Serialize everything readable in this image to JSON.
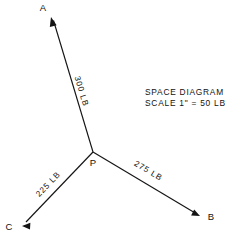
{
  "diagram": {
    "title_lines": {
      "line1": "SPACE  DIAGRAM",
      "line2": "SCALE  1\" = 50 LB"
    },
    "origin": {
      "label": "P",
      "x": 93,
      "y": 152
    },
    "stroke_color": "#141414",
    "text_color": "#111111",
    "background_color": "#ffffff",
    "forces": [
      {
        "id": "force-a",
        "endpoint_label": "A",
        "magnitude": "300 LB",
        "magnitude_value": 300,
        "units": "LB",
        "tip_x": 51,
        "tip_y": 17,
        "label_x": 43,
        "label_y": 11
      },
      {
        "id": "force-b",
        "endpoint_label": "B",
        "magnitude": "275 LB",
        "magnitude_value": 275,
        "units": "LB",
        "tip_x": 200,
        "tip_y": 216,
        "label_x": 211,
        "label_y": 220
      },
      {
        "id": "force-c",
        "endpoint_label": "C",
        "magnitude": "225 LB",
        "magnitude_value": 225,
        "units": "LB",
        "tip_x": 22,
        "tip_y": 226,
        "label_x": 9,
        "label_y": 230
      }
    ]
  }
}
